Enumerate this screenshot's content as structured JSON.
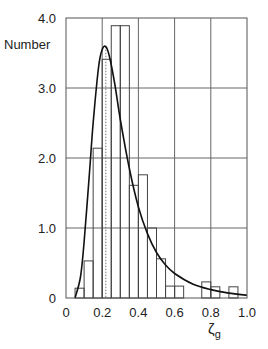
{
  "chart_data": {
    "type": "bar",
    "title": "",
    "xlabel": "ζg",
    "ylabel": "Number",
    "xlim": [
      0,
      1.0
    ],
    "ylim": [
      0,
      4.0
    ],
    "grid": true,
    "x_ticks": [
      "0",
      "0.2",
      "0.4",
      "0.6",
      "0.8",
      "1.0"
    ],
    "y_ticks": [
      "0",
      "1.0",
      "2.0",
      "3.0",
      "4.0"
    ],
    "bin_width": 0.05,
    "histogram": {
      "bin_starts": [
        0.05,
        0.1,
        0.15,
        0.2,
        0.25,
        0.3,
        0.35,
        0.4,
        0.45,
        0.5,
        0.55,
        0.6,
        0.75,
        0.8,
        0.9
      ],
      "values": [
        0.14,
        0.53,
        2.14,
        3.41,
        3.89,
        3.89,
        1.61,
        1.76,
        1.0,
        0.56,
        0.17,
        0.17,
        0.23,
        0.16,
        0.16
      ]
    },
    "fit_curve": {
      "type": "line",
      "description": "log-normal fit",
      "x": [
        0.05,
        0.08,
        0.1,
        0.13,
        0.15,
        0.18,
        0.2,
        0.22,
        0.24,
        0.27,
        0.3,
        0.35,
        0.4,
        0.45,
        0.5,
        0.55,
        0.6,
        0.7,
        0.8,
        0.9,
        1.0
      ],
      "y": [
        0.0,
        0.3,
        0.8,
        1.8,
        2.5,
        3.3,
        3.55,
        3.59,
        3.45,
        3.05,
        2.55,
        1.85,
        1.3,
        0.92,
        0.65,
        0.47,
        0.35,
        0.2,
        0.12,
        0.07,
        0.04
      ]
    },
    "mode_marker": {
      "x": 0.22,
      "style": "dotted"
    }
  },
  "axes": {
    "y_label": "Number",
    "x_label_main": "ζ",
    "x_label_sub": "g"
  }
}
